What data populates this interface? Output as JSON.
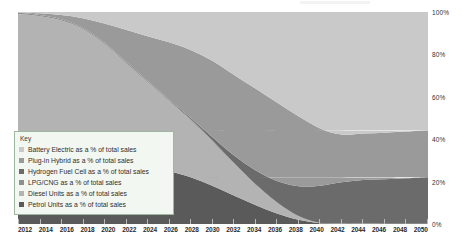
{
  "legend": {
    "title": "Key",
    "items": [
      {
        "label": "Battery Electric as a % of total sales",
        "color": "#c9c9c9",
        "key": "battery_electric"
      },
      {
        "label": "Plug-in Hybrid as a % of total sales",
        "color": "#9a9a9a",
        "key": "plug_in_hybrid"
      },
      {
        "label": "Hydrogen Fuel Cell as a % of total sales",
        "color": "#6b6b6b",
        "key": "hydrogen_fuel_cell"
      },
      {
        "label": "LPG/CNG as a % of total sales",
        "color": "#8f8f8f",
        "key": "lpg_cng"
      },
      {
        "label": "Diesel Units as a % of total sales",
        "color": "#b3b3b3",
        "key": "diesel_units"
      },
      {
        "label": "Petrol Units as a % of total sales",
        "color": "#5a5a5a",
        "key": "petrol_units"
      }
    ]
  },
  "y_axis": {
    "ticks": [
      "100%",
      "80%",
      "60%",
      "40%",
      "20%",
      "0%"
    ],
    "values": [
      100,
      80,
      60,
      40,
      20,
      0
    ]
  },
  "x_axis": {
    "ticks": [
      "2012",
      "2014",
      "2016",
      "2018",
      "2020",
      "2022",
      "2024",
      "2026",
      "2028",
      "2030",
      "2032",
      "2034",
      "2036",
      "2038",
      "2040",
      "2042",
      "2044",
      "2046",
      "2048",
      "2050"
    ]
  },
  "chart_data": {
    "type": "area",
    "title": "",
    "xlabel": "",
    "ylabel": "",
    "ylim": [
      0,
      100
    ],
    "xlim": [
      2012,
      2050
    ],
    "stacked": true,
    "percent_stacked": true,
    "grid": false,
    "legend_position": "inside-bottom-left",
    "x": [
      2012,
      2014,
      2016,
      2018,
      2020,
      2022,
      2024,
      2026,
      2028,
      2030,
      2032,
      2034,
      2036,
      2038,
      2040,
      2042,
      2044,
      2046,
      2048,
      2050
    ],
    "series": [
      {
        "name": "Petrol Units as a % of total sales",
        "color": "#5a5a5a",
        "values": [
          38,
          37.5,
          37,
          36,
          34,
          31,
          28,
          25,
          22,
          18,
          13.5,
          9,
          5,
          2,
          0.4,
          0,
          0,
          0,
          0,
          0
        ]
      },
      {
        "name": "Diesel Units as a % of total sales",
        "color": "#b3b3b3",
        "values": [
          61,
          60.5,
          59,
          56,
          51,
          45,
          39,
          33,
          27,
          21,
          15,
          9.5,
          5,
          1.5,
          0,
          0,
          0,
          0,
          0,
          0
        ]
      },
      {
        "name": "LPG/CNG as a % of total sales",
        "color": "#8f8f8f",
        "values": [
          0.6,
          0.6,
          0.6,
          0.6,
          0.6,
          0.6,
          0.6,
          0.5,
          0.5,
          0.5,
          0.4,
          0.4,
          0.3,
          0.3,
          0.2,
          0.2,
          0.2,
          0.1,
          0.1,
          0.1
        ]
      },
      {
        "name": "Hydrogen Fuel Cell as a % of total sales",
        "color": "#6b6b6b",
        "values": [
          0,
          0,
          0,
          0,
          0,
          0,
          0,
          0.2,
          0.6,
          1.5,
          3.5,
          6.5,
          10,
          14,
          17.5,
          19.5,
          20.5,
          21,
          21.5,
          22
        ]
      },
      {
        "name": "Plug-in Hybrid as a % of total sales",
        "color": "#9a9a9a",
        "values": [
          0.3,
          0.8,
          2,
          4.5,
          9,
          15,
          21,
          27,
          32,
          36,
          38,
          38.5,
          37,
          33,
          27,
          22.5,
          22,
          22,
          22,
          22
        ]
      },
      {
        "name": "Battery Electric as a % of total sales",
        "color": "#c9c9c9",
        "values": [
          0.1,
          0.6,
          1.4,
          2.9,
          5.4,
          8.4,
          11.4,
          14.3,
          17.9,
          23,
          29.6,
          36.1,
          42.7,
          49.2,
          54.9,
          57.8,
          57.3,
          56.9,
          56.4,
          55.9
        ]
      }
    ]
  }
}
